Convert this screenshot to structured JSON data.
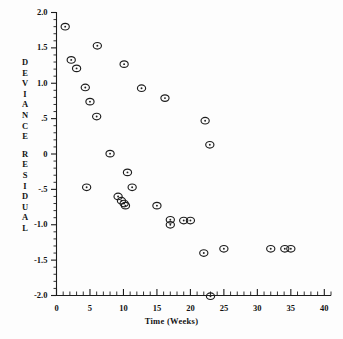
{
  "chart_data": {
    "type": "scatter",
    "title": "",
    "xlabel": "Time (Weeks)",
    "ylabel": "DEVIANCE RESIDUAL",
    "ylabel_letters": [
      "D",
      "E",
      "V",
      "I",
      "A",
      "N",
      "C",
      "E",
      "",
      "R",
      "E",
      "S",
      "I",
      "D",
      "U",
      "A",
      "L"
    ],
    "xlim": [
      0,
      41
    ],
    "ylim": [
      -2.0,
      2.0
    ],
    "xticks": [
      0,
      5,
      10,
      15,
      20,
      25,
      30,
      35,
      40
    ],
    "xtick_labels": [
      "0",
      "5",
      "10",
      "15",
      "20",
      "25",
      "30",
      "35",
      "40"
    ],
    "xtick_minor_step": 1,
    "yticks": [
      -2.0,
      -1.5,
      -1.0,
      -0.5,
      0,
      0.5,
      1.0,
      1.5,
      2.0
    ],
    "ytick_labels": [
      "-2.0",
      "-1.5",
      "-1.0",
      "-.5",
      "0",
      ".5",
      "1.0",
      "1.5",
      "2.0"
    ],
    "ytick_minor_step": 0.1,
    "grid": false,
    "legend": false,
    "marker": "circle-with-center-dot",
    "marker_color": "#1d1d1d",
    "points": [
      {
        "x": 1.3,
        "y": 1.8
      },
      {
        "x": 2.2,
        "y": 1.33
      },
      {
        "x": 3.0,
        "y": 1.21
      },
      {
        "x": 4.3,
        "y": 0.94
      },
      {
        "x": 5.0,
        "y": 0.74
      },
      {
        "x": 6.1,
        "y": 1.53
      },
      {
        "x": 6.0,
        "y": 0.53
      },
      {
        "x": 4.5,
        "y": -0.47
      },
      {
        "x": 8.0,
        "y": 0.005
      },
      {
        "x": 9.2,
        "y": -0.6
      },
      {
        "x": 9.7,
        "y": -0.66
      },
      {
        "x": 10.1,
        "y": -0.7
      },
      {
        "x": 10.3,
        "y": -0.73
      },
      {
        "x": 10.1,
        "y": 1.27
      },
      {
        "x": 10.6,
        "y": -0.26
      },
      {
        "x": 11.3,
        "y": -0.47
      },
      {
        "x": 12.7,
        "y": 0.93
      },
      {
        "x": 15.0,
        "y": -0.73
      },
      {
        "x": 16.2,
        "y": 0.79
      },
      {
        "x": 17.0,
        "y": -0.93
      },
      {
        "x": 17.0,
        "y": -1.0
      },
      {
        "x": 19.0,
        "y": -0.94
      },
      {
        "x": 20.0,
        "y": -0.94
      },
      {
        "x": 22.2,
        "y": 0.47
      },
      {
        "x": 22.9,
        "y": 0.13
      },
      {
        "x": 22.0,
        "y": -1.4
      },
      {
        "x": 25.0,
        "y": -1.34
      },
      {
        "x": 23.0,
        "y": -2.01
      },
      {
        "x": 32.0,
        "y": -1.34
      },
      {
        "x": 34.1,
        "y": -1.34
      },
      {
        "x": 35.0,
        "y": -1.34
      }
    ]
  }
}
